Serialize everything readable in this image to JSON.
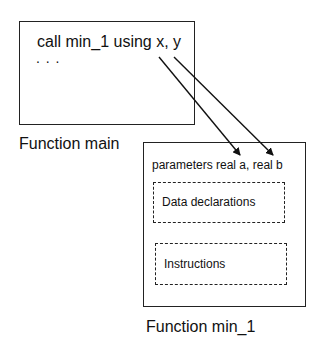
{
  "main_box": {
    "code_line": "call min_1 using x, y",
    "ellipsis": ". . .",
    "label": "Function main"
  },
  "min_box": {
    "params": "parameters real a, real b",
    "data_section": "Data declarations",
    "instructions_section": "Instructions",
    "label": "Function min_1"
  },
  "arrows": [
    {
      "from": "x",
      "to": "a"
    },
    {
      "from": "y",
      "to": "b"
    }
  ]
}
